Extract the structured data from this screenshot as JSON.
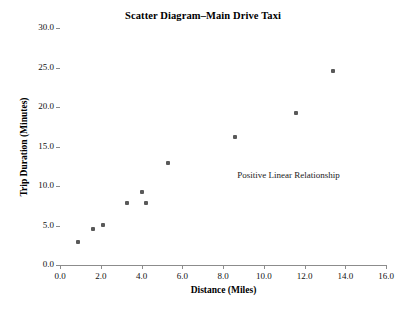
{
  "chart_data": {
    "type": "scatter",
    "title": "Scatter Diagram–Main Drive Taxi",
    "xlabel": "Distance (Miles)",
    "ylabel": "Trip Duration (Minutes)",
    "xlim": [
      0.0,
      16.0
    ],
    "ylim": [
      0.0,
      30.0
    ],
    "xticks": [
      "0.0",
      "2.0",
      "4.0",
      "6.0",
      "8.0",
      "10.0",
      "12.0",
      "14.0",
      "16.0"
    ],
    "xtick_values": [
      0.0,
      2.0,
      4.0,
      6.0,
      8.0,
      10.0,
      12.0,
      14.0,
      16.0
    ],
    "yticks": [
      "0.0",
      "5.0",
      "10.0",
      "15.0",
      "20.0",
      "25.0",
      "30.0"
    ],
    "ytick_values": [
      0.0,
      5.0,
      10.0,
      15.0,
      20.0,
      25.0,
      30.0
    ],
    "grid": false,
    "legend": false,
    "point_color": "#595959",
    "axis_color": "#8c8c8c",
    "x": [
      0.9,
      1.6,
      2.1,
      3.3,
      4.0,
      4.2,
      5.3,
      8.6,
      11.6,
      13.4
    ],
    "y": [
      2.9,
      4.6,
      5.1,
      7.8,
      9.3,
      7.9,
      12.9,
      16.2,
      19.2,
      24.5
    ],
    "points": [
      {
        "x": 0.9,
        "y": 2.9
      },
      {
        "x": 1.6,
        "y": 4.6
      },
      {
        "x": 2.1,
        "y": 5.1
      },
      {
        "x": 3.3,
        "y": 7.8
      },
      {
        "x": 4.0,
        "y": 9.3
      },
      {
        "x": 4.2,
        "y": 7.9
      },
      {
        "x": 5.3,
        "y": 12.9
      },
      {
        "x": 8.6,
        "y": 16.2
      },
      {
        "x": 11.6,
        "y": 19.2
      },
      {
        "x": 13.4,
        "y": 24.5
      }
    ],
    "annotations": [
      {
        "text": "Positive Linear Relationship",
        "x": 8.7,
        "y": 11.3
      }
    ]
  }
}
